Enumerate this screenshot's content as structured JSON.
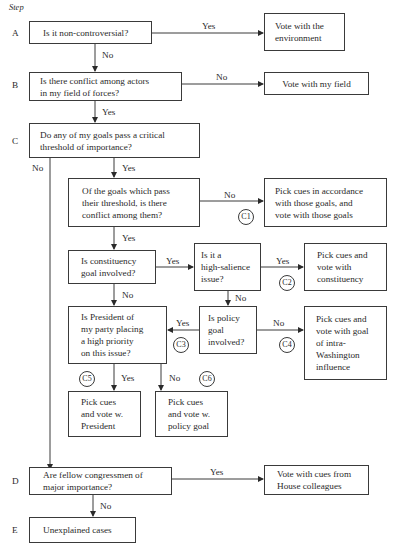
{
  "header": {
    "step_label": "Step"
  },
  "steps": {
    "A": "A",
    "B": "B",
    "C": "C",
    "D": "D",
    "E": "E"
  },
  "nodes": {
    "a_question": "Is it non-controversial?",
    "a_result": "Vote with the\nenvironment",
    "b_question": "Is there conflict among actors\nin my field of forces?",
    "b_result": "Vote with my field",
    "c_question": "Do any of my goals pass a critical\nthreshold of importance?",
    "c1_question": "Of the goals which pass\ntheir threshold, is there\nconflict among them?",
    "c1_result": "Pick cues in accordance\nwith those goals, and\nvote with those goals",
    "constituency_question": "Is constituency\ngoal involved?",
    "salience_question": "Is it a\nhigh-salience\nissue?",
    "c2_result": "Pick cues and\nvote with\nconstituency",
    "president_question": "Is President of\nmy party placing\na high priority\non this issue?",
    "policy_question": "Is policy\ngoal\ninvolved?",
    "c4_result": "Pick cues and\nvote with goal\nof intra-\nWashington\ninfluence",
    "c5_result": "Pick cues\nand vote w.\nPresident",
    "c6_result": "Pick cues\nand vote w.\npolicy goal",
    "d_question": "Are fellow congressmen of\nmajor importance?",
    "d_result": "Vote with cues from\nHouse colleagues",
    "e_result": "Unexplained cases"
  },
  "edge_labels": {
    "a_yes": "Yes",
    "a_no": "No",
    "b_no": "No",
    "b_yes": "Yes",
    "c_yes": "Yes",
    "c_no": "No",
    "c1_no": "No",
    "c1_yes": "Yes",
    "constituency_yes": "Yes",
    "constituency_no": "No",
    "salience_yes": "Yes",
    "salience_no": "No",
    "policy_yes": "Yes",
    "policy_no": "No",
    "president_yes": "Yes",
    "president_no": "No",
    "d_yes": "Yes",
    "d_no": "No"
  },
  "markers": {
    "c1": "C1",
    "c2": "C2",
    "c3": "C3",
    "c4": "C4",
    "c5": "C5",
    "c6": "C6"
  },
  "colors": {
    "line": "#3a3a3a",
    "text": "#2a2a2a",
    "background": "#ffffff"
  }
}
